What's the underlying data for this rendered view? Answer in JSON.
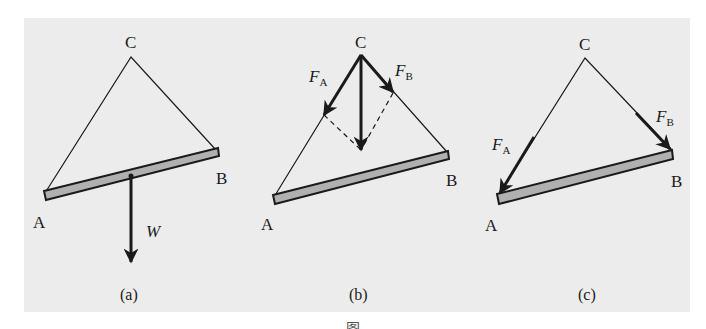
{
  "figure": {
    "background_color": "#ececec",
    "beam_fill": "#b0b0b0",
    "line_color": "#1a1a1a",
    "bottom_caption_partial": "图"
  },
  "panels": [
    {
      "id": "a",
      "caption": "(a)",
      "points": {
        "A": "A",
        "B": "B",
        "C": "C"
      },
      "forces": [
        {
          "label": "W",
          "direction": "down"
        }
      ]
    },
    {
      "id": "b",
      "caption": "(b)",
      "points": {
        "A": "A",
        "B": "B",
        "C": "C"
      },
      "forces": [
        {
          "label": "F",
          "subscript": "A",
          "direction": "along CA"
        },
        {
          "label": "F",
          "subscript": "B",
          "direction": "along CB"
        },
        {
          "label": "",
          "direction": "down (resultant)"
        }
      ]
    },
    {
      "id": "c",
      "caption": "(c)",
      "points": {
        "A": "A",
        "B": "B",
        "C": "C"
      },
      "forces": [
        {
          "label": "F",
          "subscript": "A",
          "direction": "toward A"
        },
        {
          "label": "F",
          "subscript": "B",
          "direction": "toward B"
        }
      ]
    }
  ]
}
